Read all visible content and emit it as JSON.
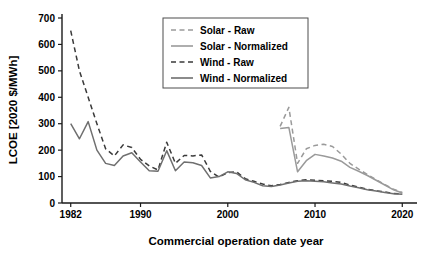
{
  "chart_data": {
    "type": "line",
    "title": "",
    "xlabel": "Commercial operation date year",
    "ylabel": "LCOE [2020 $/MWh]",
    "xlim": [
      1981,
      2021
    ],
    "ylim": [
      0,
      700
    ],
    "xticks": [
      1982,
      1990,
      2000,
      2010,
      2020
    ],
    "xtick_labels": [
      "1982",
      "1990",
      "2000",
      "2010",
      "2020"
    ],
    "yticks": [
      0,
      100,
      200,
      300,
      400,
      500,
      600,
      700
    ],
    "ytick_labels": [
      "0",
      "100",
      "200",
      "300",
      "400",
      "500",
      "600",
      "700"
    ],
    "grid": false,
    "legend_position": "upper center-right",
    "series": [
      {
        "name": "Solar - Raw",
        "style": "dashed",
        "color": "#9a9a9a",
        "x": [
          2006,
          2007,
          2008,
          2009,
          2010,
          2011,
          2012,
          2013,
          2014,
          2015,
          2016,
          2017,
          2018,
          2019,
          2020
        ],
        "values": [
          290,
          362,
          150,
          205,
          218,
          222,
          214,
          185,
          150,
          128,
          108,
          88,
          70,
          52,
          40
        ]
      },
      {
        "name": "Solar - Normalized",
        "style": "solid",
        "color": "#9a9a9a",
        "x": [
          2006,
          2007,
          2008,
          2009,
          2010,
          2011,
          2012,
          2013,
          2014,
          2015,
          2016,
          2017,
          2018,
          2019,
          2020
        ],
        "values": [
          282,
          286,
          118,
          160,
          184,
          178,
          170,
          158,
          135,
          120,
          104,
          86,
          68,
          50,
          38
        ]
      },
      {
        "name": "Wind - Raw",
        "style": "dashed",
        "color": "#3a3a3a",
        "x": [
          1982,
          1983,
          1984,
          1985,
          1986,
          1987,
          1988,
          1989,
          1990,
          1991,
          1992,
          1993,
          1994,
          1995,
          1996,
          1997,
          1998,
          1999,
          2000,
          2001,
          2002,
          2003,
          2004,
          2005,
          2006,
          2007,
          2008,
          2009,
          2010,
          2011,
          2012,
          2013,
          2014,
          2015,
          2016,
          2017,
          2018,
          2019,
          2020
        ],
        "values": [
          652,
          500,
          400,
          300,
          205,
          178,
          220,
          210,
          165,
          140,
          125,
          230,
          150,
          180,
          178,
          182,
          120,
          98,
          115,
          118,
          92,
          82,
          72,
          65,
          70,
          78,
          84,
          88,
          86,
          84,
          82,
          78,
          68,
          60,
          52,
          46,
          42,
          36,
          34
        ]
      },
      {
        "name": "Wind - Normalized",
        "style": "solid",
        "color": "#6f6f6f",
        "x": [
          1982,
          1983,
          1984,
          1985,
          1986,
          1987,
          1988,
          1989,
          1990,
          1991,
          1992,
          1993,
          1994,
          1995,
          1996,
          1997,
          1998,
          1999,
          2000,
          2001,
          2002,
          2003,
          2004,
          2005,
          2006,
          2007,
          2008,
          2009,
          2010,
          2011,
          2012,
          2013,
          2014,
          2015,
          2016,
          2017,
          2018,
          2019,
          2020
        ],
        "values": [
          300,
          243,
          308,
          200,
          150,
          142,
          178,
          190,
          155,
          122,
          120,
          198,
          122,
          155,
          152,
          142,
          95,
          100,
          118,
          112,
          88,
          78,
          65,
          62,
          68,
          76,
          82,
          84,
          82,
          80,
          76,
          72,
          64,
          58,
          50,
          45,
          40,
          35,
          33
        ]
      }
    ]
  },
  "legend": {
    "items": [
      {
        "label": "Solar - Raw"
      },
      {
        "label": "Solar - Normalized"
      },
      {
        "label": "Wind - Raw"
      },
      {
        "label": "Wind - Normalized"
      }
    ]
  }
}
